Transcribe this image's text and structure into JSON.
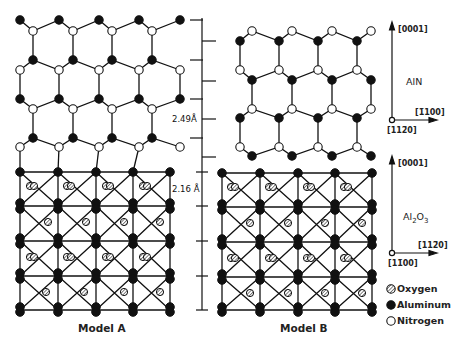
{
  "figure": {
    "models": [
      {
        "label": "Model A",
        "top_layer": "AlN",
        "bottom_layer": "Al2O3"
      },
      {
        "label": "Model B",
        "top_layer": "AlN",
        "bottom_layer": "Al2O3"
      }
    ],
    "scale": {
      "aln_spacing": "2.49Å",
      "al2o3_spacing": "2.16 Å"
    },
    "axes": {
      "aln": {
        "material": "AlN",
        "vertical": "[0001]",
        "horizontal": "[1̄100]",
        "normal": "[112̄0]"
      },
      "al2o3": {
        "material_main": "Al",
        "sub1": "2",
        "material_mid": "O",
        "sub2": "3",
        "vertical": "[0001]",
        "horizontal": "[112̄0]",
        "normal": "[11̄00]"
      }
    },
    "legend": [
      {
        "name": "Oxygen",
        "symbol": "hatched-circle"
      },
      {
        "name": "Aluminum",
        "symbol": "filled-circle"
      },
      {
        "name": "Nitrogen",
        "symbol": "open-circle"
      }
    ]
  }
}
